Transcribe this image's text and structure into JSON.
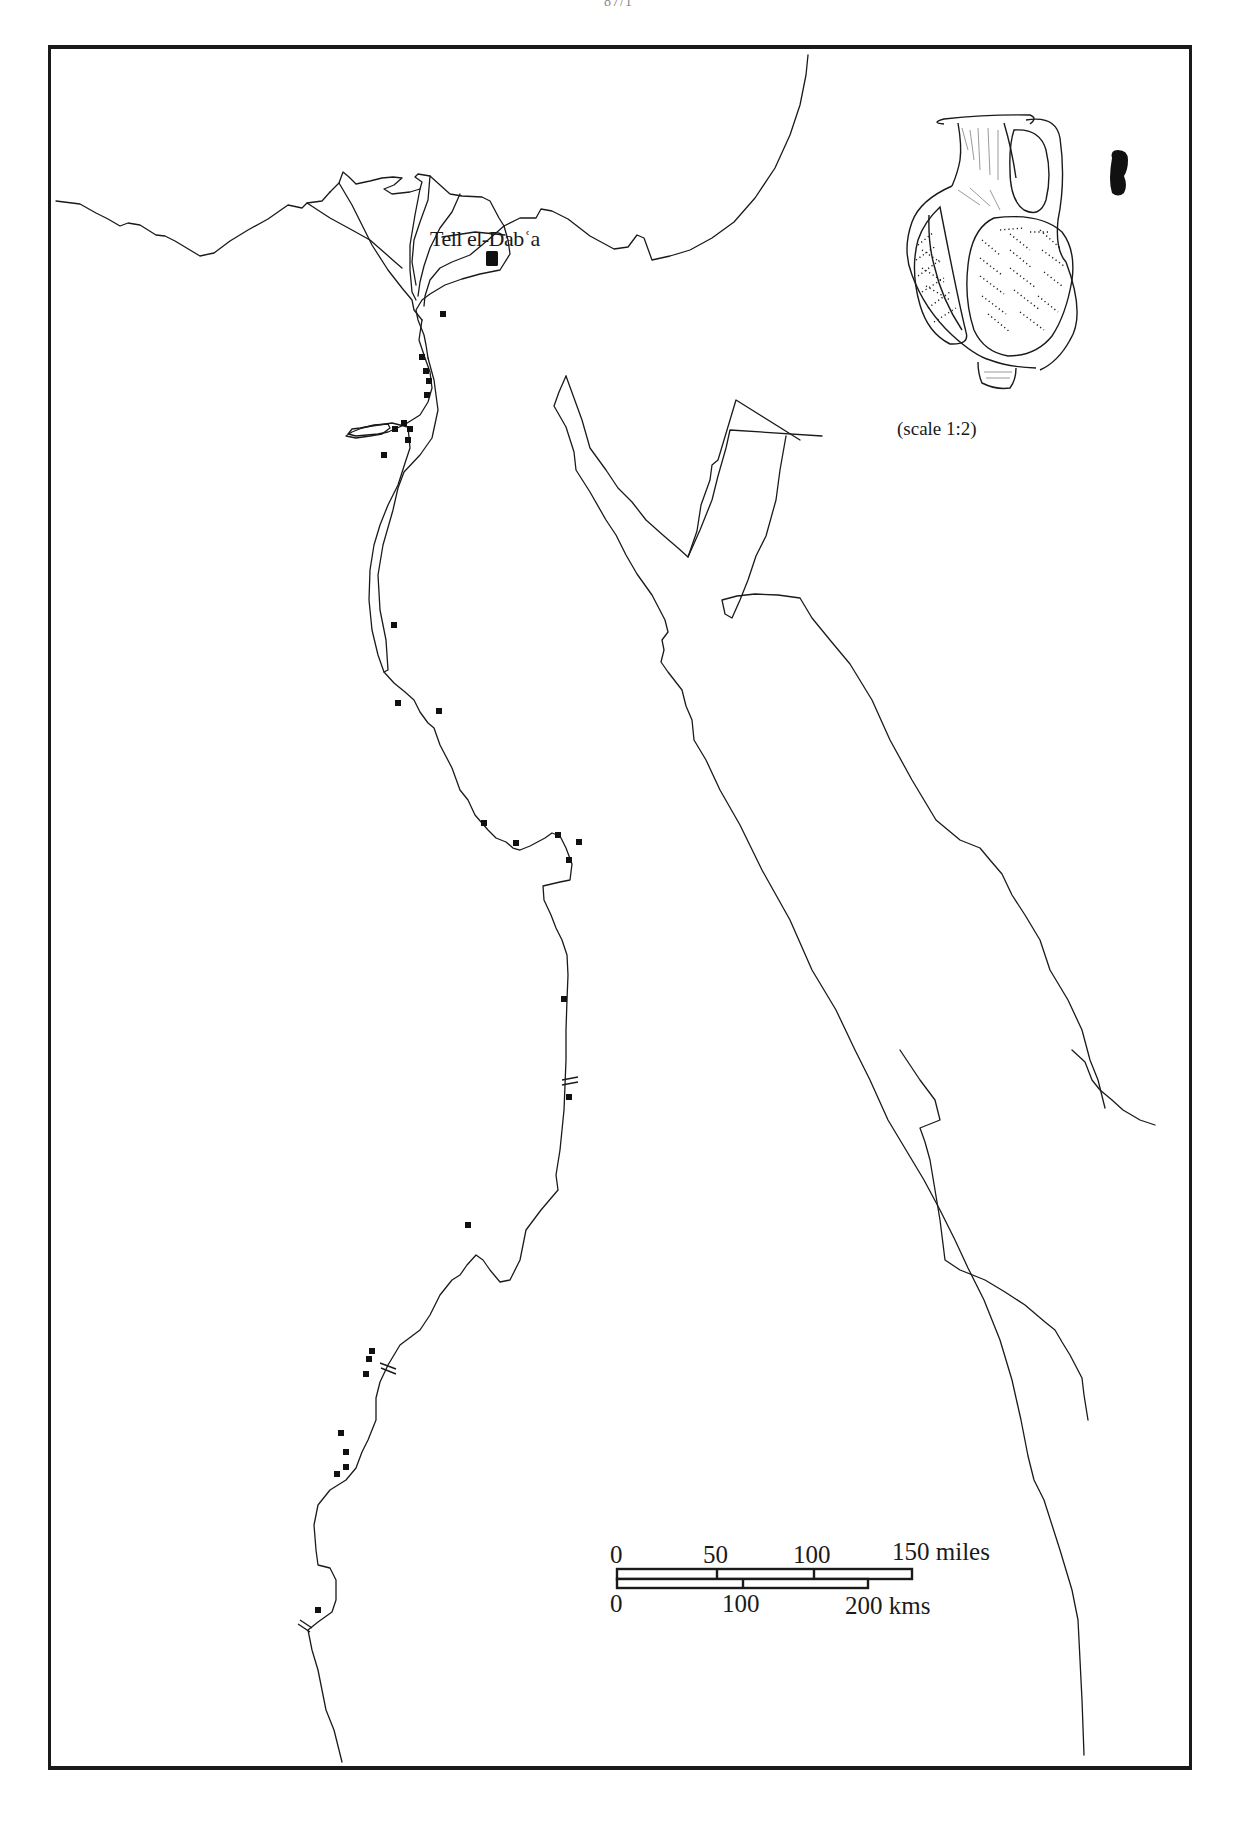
{
  "page": {
    "page_number": "87/1"
  },
  "map": {
    "site_label": "Tell el-Dabʿa",
    "site_marker": "large-square-marker",
    "find_spot_marker": "small-square-marker",
    "cataract_marker": "double-hash-mark",
    "find_spots_count": 28,
    "find_spots": [
      [
        443,
        314
      ],
      [
        422,
        357
      ],
      [
        426,
        371
      ],
      [
        429,
        381
      ],
      [
        427,
        395
      ],
      [
        394,
        428
      ],
      [
        404,
        423
      ],
      [
        410,
        428
      ],
      [
        408,
        440
      ],
      [
        384,
        455
      ],
      [
        393,
        625
      ],
      [
        398,
        703
      ],
      [
        441,
        711
      ],
      [
        483,
        823
      ],
      [
        516,
        843
      ],
      [
        558,
        835
      ],
      [
        579,
        842
      ],
      [
        567,
        862
      ],
      [
        563,
        998
      ],
      [
        569,
        1072
      ],
      [
        467,
        1225
      ],
      [
        372,
        1351
      ],
      [
        369,
        1359
      ],
      [
        366,
        1373
      ],
      [
        341,
        1433
      ],
      [
        345,
        1455
      ],
      [
        346,
        1468
      ],
      [
        336,
        1476
      ],
      [
        318,
        1610
      ]
    ],
    "cataracts": [
      [
        570,
        1085
      ],
      [
        388,
        1367
      ],
      [
        306,
        1627
      ]
    ]
  },
  "artifact": {
    "name": "jug-drawing",
    "section_profile": "black-handle-section",
    "caption": "(scale 1:2)"
  },
  "scale_bar": {
    "miles_ticks": [
      "0",
      "50",
      "100",
      "150 miles"
    ],
    "km_ticks": [
      "0",
      "100",
      "200 kms"
    ]
  },
  "colors": {
    "ink": "#1a1a1a",
    "paper": "#ffffff",
    "frame": "#1a1a1a"
  }
}
